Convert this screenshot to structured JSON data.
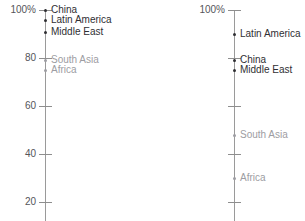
{
  "chart_data": {
    "type": "line",
    "title": "",
    "subtitle": "",
    "xlabel": "",
    "ylabel": "",
    "ylim": [
      0,
      100
    ],
    "grid": false,
    "legend_position": "inline-labels",
    "panels": [
      {
        "name": "left-panel",
        "axis": {
          "unit": "%",
          "tick_labels": [
            "100%",
            "80",
            "60",
            "40",
            "20"
          ],
          "tick_values": [
            100,
            80,
            60,
            40,
            20
          ],
          "range": [
            12,
            100
          ]
        },
        "points": [
          {
            "label": "China",
            "value": 100,
            "tone": "dark"
          },
          {
            "label": "Latin America",
            "value": 96,
            "tone": "dark"
          },
          {
            "label": "Middle East",
            "value": 91,
            "tone": "dark"
          },
          {
            "label": "South Asia",
            "value": 79,
            "tone": "light"
          },
          {
            "label": "Africa",
            "value": 75,
            "tone": "light"
          }
        ]
      },
      {
        "name": "right-panel",
        "axis": {
          "unit": "%",
          "tick_labels": [
            "100%",
            "",
            "",
            "",
            ""
          ],
          "tick_values": [
            100,
            80,
            60,
            40,
            20
          ],
          "range": [
            12,
            100
          ]
        },
        "points": [
          {
            "label": "Latin America",
            "value": 90,
            "tone": "dark"
          },
          {
            "label": "China",
            "value": 79,
            "tone": "dark"
          },
          {
            "label": "Middle East",
            "value": 75,
            "tone": "dark"
          },
          {
            "label": "South Asia",
            "value": 48,
            "tone": "light"
          },
          {
            "label": "Africa",
            "value": 30,
            "tone": "light"
          }
        ]
      }
    ],
    "colors": {
      "axis": "#9a9a9a",
      "tick": "#8e8e8e",
      "tick_label": "#55555a",
      "label_dark": "#2f2f33",
      "label_light": "#9d9da2",
      "background": "#ffffff"
    }
  }
}
